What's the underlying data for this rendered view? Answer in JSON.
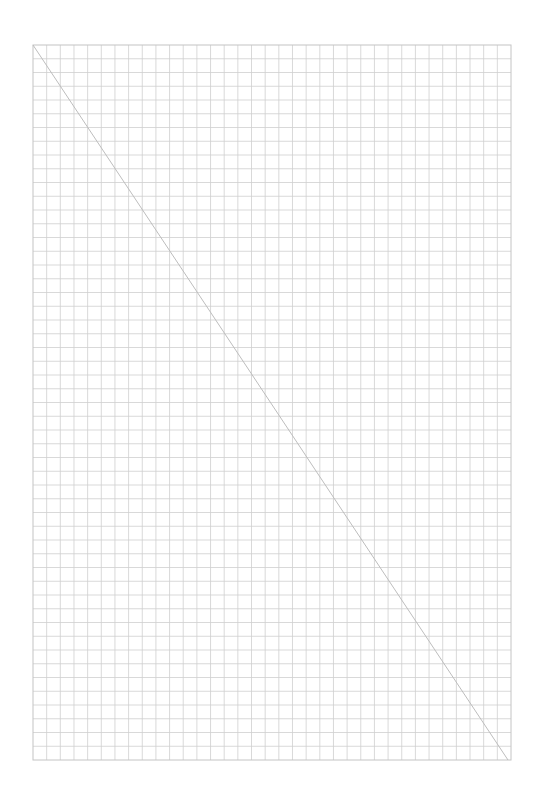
{
  "page": {
    "width": 544,
    "height": 798,
    "background": "#ffffff"
  },
  "grid": {
    "left": 33,
    "top": 45,
    "right": 511,
    "bottom": 760,
    "columns": 35,
    "rows": 52,
    "line_color": "#cfcfcf",
    "border_color": "#c4c4c4",
    "line_width": 0.8
  },
  "diagonal": {
    "x1": 33,
    "y1": 45,
    "x2": 508,
    "y2": 760,
    "color": "#bdbdbd",
    "width": 1
  }
}
